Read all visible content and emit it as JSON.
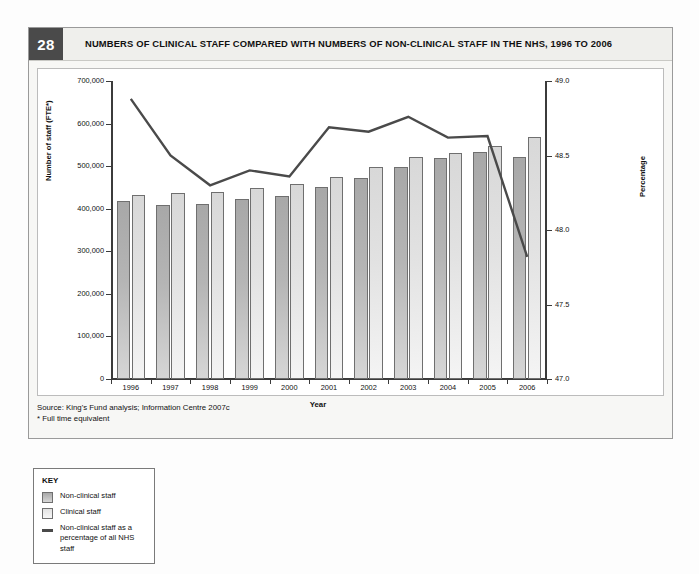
{
  "figure": {
    "number": "28",
    "title": "NUMBERS OF CLINICAL STAFF COMPARED WITH NUMBERS OF NON-CLINICAL STAFF IN THE NHS, 1996 TO 2006",
    "source_line": "Source: King's Fund analysis; Information Centre 2007c",
    "footnote_line": "* Full time equivalent"
  },
  "key": {
    "title": "KEY",
    "items": [
      {
        "label": "Non-clinical staff",
        "type": "swatch-non-clinical",
        "color": "#b5b5b5"
      },
      {
        "label": "Clinical staff",
        "type": "swatch-clinical",
        "color": "#e2e2e2"
      },
      {
        "label": "Non-clinical staff as a percentage of all NHS staff",
        "type": "line",
        "color": "#4a4a4a"
      }
    ]
  },
  "chart_data": {
    "type": "bar",
    "title": "NUMBERS OF CLINICAL STAFF COMPARED WITH NUMBERS OF NON-CLINICAL STAFF IN THE NHS, 1996 TO 2006",
    "xlabel": "Year",
    "ylabel": "Number of staff (FTE*)",
    "y2label": "Percentage",
    "categories": [
      "1996",
      "1997",
      "1998",
      "1999",
      "2000",
      "2001",
      "2002",
      "2003",
      "2004",
      "2005",
      "2006"
    ],
    "ylim": [
      0,
      700000
    ],
    "yticks": [
      "0",
      "100,000",
      "200,000",
      "300,000",
      "400,000",
      "500,000",
      "600,000",
      "700,000"
    ],
    "ytick_values": [
      0,
      100000,
      200000,
      300000,
      400000,
      500000,
      600000,
      700000
    ],
    "y2lim": [
      47.0,
      49.0
    ],
    "y2ticks": [
      "47.0",
      "47.5",
      "48.0",
      "48.5",
      "49.0"
    ],
    "y2tick_values": [
      47.0,
      47.5,
      48.0,
      48.5,
      49.0
    ],
    "grid": false,
    "legend_position": "external-key-box",
    "series": [
      {
        "name": "Non-clinical staff",
        "kind": "bar",
        "axis": "left",
        "color": "#b5b5b5",
        "values": [
          417000,
          409000,
          411000,
          422000,
          431000,
          452000,
          473000,
          497000,
          518000,
          534000,
          521000
        ]
      },
      {
        "name": "Clinical staff",
        "kind": "bar",
        "axis": "left",
        "color": "#e2e2e2",
        "values": [
          433000,
          436000,
          439000,
          449000,
          459000,
          475000,
          499000,
          522000,
          531000,
          548000,
          569000
        ]
      },
      {
        "name": "Non-clinical staff as a percentage of all NHS staff",
        "kind": "line",
        "axis": "right",
        "color": "#4a4a4a",
        "values": [
          48.88,
          48.5,
          48.3,
          48.4,
          48.36,
          48.69,
          48.66,
          48.76,
          48.62,
          48.63,
          47.82
        ]
      }
    ]
  }
}
